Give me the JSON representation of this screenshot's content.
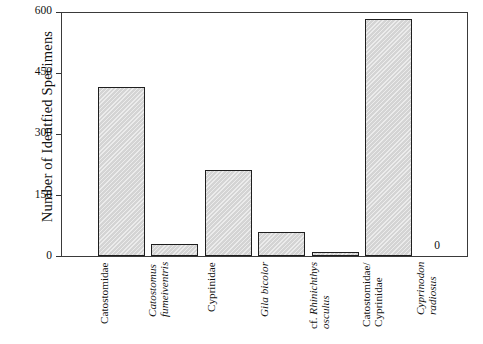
{
  "chart_data": {
    "type": "bar",
    "title": "",
    "xlabel": "",
    "ylabel": "Number of Identfied Specimens",
    "ylim": [
      0,
      645
    ],
    "yticks": [
      0,
      150,
      300,
      450,
      600
    ],
    "ytick_labels": [
      "0",
      "150",
      "300",
      "450",
      "600"
    ],
    "grid": false,
    "legend": null,
    "categories": [
      "Catostomidae",
      "Catostomus fumeiventris",
      "Cyprinidae",
      "Gila bicolor",
      "cf. Rhinichthys osculus",
      "Catostomidae/ Cyprinidae",
      "Cyprinodon radiosus"
    ],
    "values": [
      448,
      31,
      228,
      64,
      3,
      628,
      0
    ],
    "annotations": [
      {
        "category": "Cyprinodon radiosus",
        "text": "0"
      }
    ]
  },
  "axis": {
    "y_title": "Number of Identfied Specimens",
    "y_ticks": [
      {
        "label": "600",
        "value": 600
      },
      {
        "label": "450",
        "value": 450
      },
      {
        "label": "300",
        "value": 300
      },
      {
        "label": "150",
        "value": 150
      },
      {
        "label": "0",
        "value": 0
      }
    ]
  },
  "bars": [
    {
      "name": "catostomidae",
      "value": 448,
      "label_lines": [
        {
          "text": "Catostomidae",
          "style": "roman"
        }
      ]
    },
    {
      "name": "catostomus-fumeiventris",
      "value": 31,
      "label_lines": [
        {
          "text": "Catostomus",
          "style": "italic"
        },
        {
          "text": "fumeiventris",
          "style": "italic"
        }
      ]
    },
    {
      "name": "cyprinidae",
      "value": 228,
      "label_lines": [
        {
          "text": "Cyprinidae",
          "style": "roman"
        }
      ]
    },
    {
      "name": "gila-bicolor",
      "value": 64,
      "label_lines": [
        {
          "text": "Gila bicolor",
          "style": "italic"
        }
      ]
    },
    {
      "name": "cf-rhinichthys-osculus",
      "value": 3,
      "label_lines": [
        {
          "text": "cf. Rhinichthys",
          "style": "mixed"
        },
        {
          "text": "osculus",
          "style": "italic"
        }
      ]
    },
    {
      "name": "catostomidae-cyprinidae",
      "value": 628,
      "label_lines": [
        {
          "text": "Catostomidae/",
          "style": "roman"
        },
        {
          "text": "Cyprinidae",
          "style": "roman"
        }
      ]
    },
    {
      "name": "cyprinodon-radiosus",
      "value": 0,
      "value_label": "0",
      "label_lines": [
        {
          "text": "Cyprinodon",
          "style": "italic"
        },
        {
          "text": "radiosus",
          "style": "italic"
        }
      ]
    }
  ],
  "colors": {
    "bar_fill": "#d4d4d4",
    "bar_stroke": "#1f1f1f",
    "frame": "#3a3a3a",
    "text": "#111111",
    "background": "#ffffff"
  }
}
